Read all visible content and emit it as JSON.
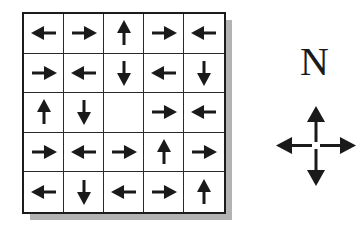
{
  "grid": {
    "rows": 5,
    "cols": 5,
    "cells": [
      [
        "left",
        "right",
        "up",
        "right",
        "left"
      ],
      [
        "right",
        "left",
        "down",
        "left",
        "down"
      ],
      [
        "up",
        "down",
        "empty",
        "right",
        "left"
      ],
      [
        "right",
        "left",
        "right",
        "up",
        "right"
      ],
      [
        "left",
        "down",
        "left",
        "right",
        "up"
      ]
    ]
  },
  "compass": {
    "label": "N",
    "arrows": [
      "up",
      "left",
      "down",
      "right"
    ]
  },
  "colors": {
    "arrow": "#1a1a1a",
    "grid_line": "#2a2a2a",
    "shadow": "#b3b3b3"
  }
}
